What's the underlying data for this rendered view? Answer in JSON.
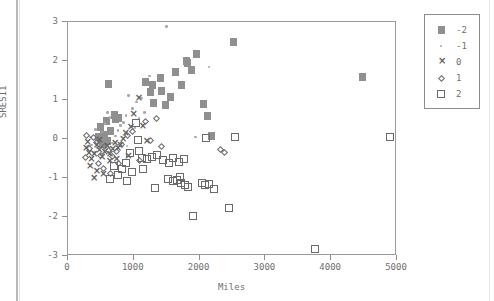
{
  "chart_data": {
    "type": "scatter",
    "title": "",
    "xlabel": "Miles",
    "ylabel": "SRESI1",
    "xlim": [
      0,
      5000
    ],
    "ylim": [
      -3,
      3
    ],
    "xticks": [
      0,
      1000,
      2000,
      3000,
      4000,
      5000
    ],
    "yticks": [
      3,
      2,
      1,
      0,
      -1,
      -2,
      -3
    ],
    "grid": false,
    "legend_position": "outside-top-right",
    "legend_title": "",
    "series": [
      {
        "name": "-2",
        "marker": "filled-square",
        "color": "#8f8f8f",
        "points": [
          [
            620,
            1.42
          ],
          [
            700,
            0.62
          ],
          [
            720,
            0.52
          ],
          [
            760,
            0.55
          ],
          [
            540,
            0.1
          ],
          [
            560,
            0.02
          ],
          [
            600,
            -0.05
          ],
          [
            640,
            0.2
          ],
          [
            500,
            0.3
          ],
          [
            470,
            0.05
          ],
          [
            520,
            -0.12
          ],
          [
            580,
            0.45
          ],
          [
            1180,
            1.45
          ],
          [
            1260,
            1.2
          ],
          [
            1280,
            1.38
          ],
          [
            1300,
            0.92
          ],
          [
            1400,
            1.56
          ],
          [
            1420,
            1.22
          ],
          [
            1480,
            0.88
          ],
          [
            1560,
            1.08
          ],
          [
            1720,
            1.38
          ],
          [
            1800,
            2.0
          ],
          [
            1820,
            1.95
          ],
          [
            1880,
            1.78
          ],
          [
            1960,
            2.18
          ],
          [
            2060,
            0.9
          ],
          [
            2120,
            0.6
          ],
          [
            2180,
            0.08
          ],
          [
            2520,
            2.48
          ],
          [
            4480,
            1.6
          ],
          [
            1640,
            1.72
          ]
        ]
      },
      {
        "name": "-1",
        "marker": "small-dot",
        "color": "#a8a8a8",
        "points": [
          [
            1500,
            2.88
          ],
          [
            1240,
            1.62
          ],
          [
            1120,
            1.05
          ],
          [
            1040,
            0.95
          ],
          [
            980,
            0.78
          ],
          [
            920,
            1.12
          ],
          [
            880,
            0.6
          ],
          [
            840,
            0.42
          ],
          [
            800,
            0.35
          ],
          [
            760,
            0.22
          ],
          [
            720,
            0.08
          ],
          [
            680,
            -0.1
          ],
          [
            640,
            0.55
          ],
          [
            600,
            0.68
          ],
          [
            560,
            0.4
          ],
          [
            520,
            0.18
          ],
          [
            480,
            -0.02
          ],
          [
            440,
            -0.22
          ],
          [
            400,
            -0.35
          ],
          [
            360,
            -0.15
          ],
          [
            1160,
            0.68
          ],
          [
            1080,
            0.52
          ],
          [
            2140,
            1.85
          ],
          [
            1940,
            0.05
          ],
          [
            420,
            0.25
          ],
          [
            340,
            0.05
          ],
          [
            900,
            -0.18
          ],
          [
            1020,
            0.3
          ]
        ]
      },
      {
        "name": "0",
        "marker": "x",
        "color": "#5e5e5e",
        "points": [
          [
            1060,
            1.02
          ],
          [
            980,
            0.62
          ],
          [
            940,
            0.28
          ],
          [
            1120,
            0.3
          ],
          [
            1180,
            -0.08
          ],
          [
            860,
            0.12
          ],
          [
            820,
            -0.02
          ],
          [
            780,
            -0.18
          ],
          [
            740,
            -0.25
          ],
          [
            700,
            -0.12
          ],
          [
            660,
            -0.28
          ],
          [
            620,
            -0.4
          ],
          [
            580,
            -0.2
          ],
          [
            540,
            -0.35
          ],
          [
            500,
            -0.48
          ],
          [
            460,
            -0.3
          ],
          [
            420,
            -0.18
          ],
          [
            380,
            -0.42
          ],
          [
            340,
            -0.55
          ],
          [
            300,
            -0.38
          ],
          [
            260,
            -0.25
          ],
          [
            320,
            -0.72
          ],
          [
            420,
            -0.85
          ],
          [
            520,
            -0.92
          ],
          [
            380,
            -1.02
          ],
          [
            620,
            -0.6
          ],
          [
            280,
            -0.1
          ],
          [
            720,
            -0.55
          ],
          [
            900,
            -0.45
          ],
          [
            460,
            -0.05
          ]
        ]
      },
      {
        "name": "1",
        "marker": "diamond",
        "color": "#6a6a6a",
        "points": [
          [
            1340,
            0.52
          ],
          [
            1180,
            0.45
          ],
          [
            1260,
            -0.05
          ],
          [
            980,
            0.18
          ],
          [
            900,
            0.08
          ],
          [
            820,
            -0.15
          ],
          [
            740,
            -0.32
          ],
          [
            680,
            -0.45
          ],
          [
            620,
            -0.3
          ],
          [
            560,
            -0.2
          ],
          [
            500,
            -0.42
          ],
          [
            440,
            -0.1
          ],
          [
            380,
            0.05
          ],
          [
            320,
            -0.25
          ],
          [
            280,
            0.08
          ],
          [
            260,
            -0.48
          ],
          [
            540,
            -0.75
          ],
          [
            640,
            -0.88
          ],
          [
            760,
            -0.62
          ],
          [
            1420,
            -0.18
          ],
          [
            2320,
            -0.28
          ],
          [
            2380,
            -0.35
          ],
          [
            1080,
            -0.55
          ],
          [
            460,
            -0.62
          ]
        ]
      },
      {
        "name": "2",
        "marker": "open-square",
        "color": "#6a6a6a",
        "points": [
          [
            1040,
            0.4
          ],
          [
            1060,
            -0.02
          ],
          [
            1080,
            -0.32
          ],
          [
            1120,
            -0.48
          ],
          [
            1200,
            -0.52
          ],
          [
            1280,
            -0.45
          ],
          [
            1360,
            -0.4
          ],
          [
            1440,
            -0.55
          ],
          [
            1540,
            -0.62
          ],
          [
            1600,
            -0.48
          ],
          [
            1680,
            -0.58
          ],
          [
            1760,
            -0.52
          ],
          [
            1520,
            -1.02
          ],
          [
            1600,
            -1.08
          ],
          [
            1660,
            -1.05
          ],
          [
            1700,
            -0.98
          ],
          [
            1720,
            -1.12
          ],
          [
            1780,
            -1.18
          ],
          [
            1820,
            -1.22
          ],
          [
            1900,
            -1.98
          ],
          [
            2040,
            -1.12
          ],
          [
            2080,
            -1.18
          ],
          [
            2140,
            -1.15
          ],
          [
            2220,
            -1.28
          ],
          [
            2440,
            -1.78
          ],
          [
            2100,
            0.02
          ],
          [
            2540,
            0.05
          ],
          [
            4900,
            0.05
          ],
          [
            3760,
            -2.82
          ],
          [
            940,
            -0.35
          ],
          [
            880,
            -0.62
          ],
          [
            820,
            -0.78
          ],
          [
            760,
            -0.92
          ],
          [
            700,
            -0.7
          ],
          [
            980,
            -0.85
          ],
          [
            1140,
            -0.78
          ],
          [
            640,
            -1.02
          ],
          [
            900,
            -1.08
          ],
          [
            1320,
            -1.25
          ]
        ]
      }
    ]
  },
  "legend": {
    "entries": [
      {
        "label": "-2",
        "marker": "filled-square"
      },
      {
        "label": "-1",
        "marker": "small-dot"
      },
      {
        "label": "0",
        "marker": "x-mark"
      },
      {
        "label": "1",
        "marker": "diamond"
      },
      {
        "label": "2",
        "marker": "open-square"
      }
    ]
  },
  "axes": {
    "x_title": "Miles",
    "y_title": "SRESI1",
    "x_tick_labels": [
      "0",
      "1000",
      "2000",
      "3000",
      "4000",
      "5000"
    ],
    "y_tick_labels": [
      "3",
      "2",
      "1",
      "0",
      "-1",
      "-2",
      "-3"
    ]
  },
  "colors": {
    "frame": "#9a9a9a",
    "text": "#6f6f6f",
    "series_fill": "#8f8f8f",
    "series_outline": "#6a6a6a",
    "background": "#ffffff"
  }
}
